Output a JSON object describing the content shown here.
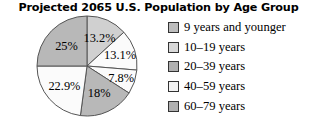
{
  "chart_data": {
    "type": "pie",
    "title": "Projected 2065 U.S. Population by Age Group",
    "xlabel": "",
    "ylabel": "",
    "legend_position": "right",
    "grid": false,
    "categories": [
      "9 years and younger",
      "10–19 years",
      "20–39 years",
      "40–59 years",
      "60–79 years",
      "80 years and older"
    ],
    "values": [
      13.2,
      13.1,
      7.8,
      18,
      22.9,
      25
    ],
    "labels": [
      "13.2%",
      "13.1%",
      "7.8%",
      "18%",
      "22.9%",
      "25%"
    ],
    "slice_colors": [
      "#d0d0d0",
      "#fbfbfb",
      "#fbfbfb",
      "#b8b8b8",
      "#fbfbfb",
      "#b8b8b8"
    ],
    "slice_order": "clockwise from 12 o'clock",
    "stroke_color": "#555555",
    "geometry": {
      "center_x": 87,
      "center_y": 52,
      "radius": 50,
      "start_angle_deg": -90
    }
  },
  "legend": {
    "items": [
      {
        "label": "9 years and younger",
        "color": "#bdbdbd"
      },
      {
        "label": "10–19 years",
        "color": "#d8d8d8"
      },
      {
        "label": "20–39 years",
        "color": "#b0b0b0"
      },
      {
        "label": "40–59 years",
        "color": "#f2f2f2"
      },
      {
        "label": "60–79 years",
        "color": "#b0b0b0"
      }
    ]
  }
}
